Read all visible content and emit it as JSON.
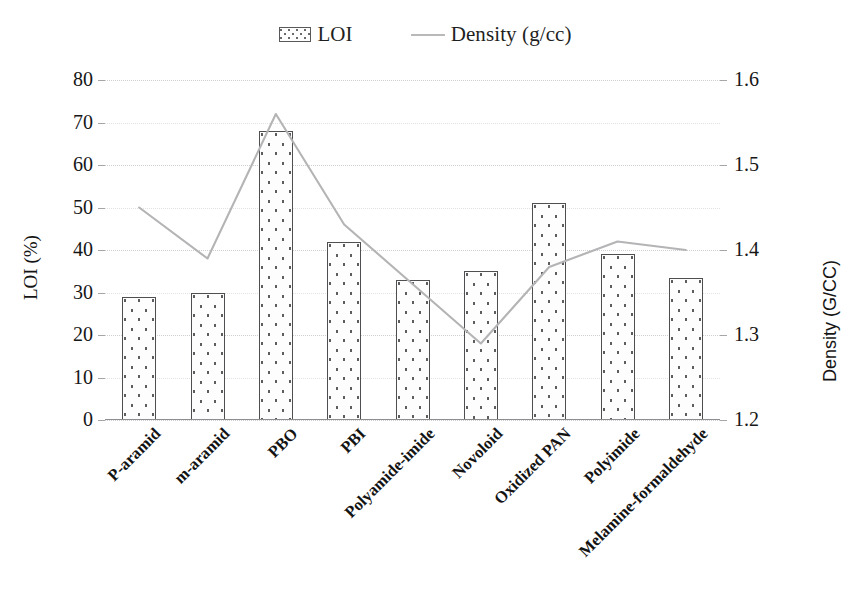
{
  "legend": {
    "position": "top-center",
    "entries": [
      {
        "label": "LOI",
        "marker": "bar-swatch-icon"
      },
      {
        "label": "Density (g/cc)",
        "marker": "line-swatch-icon"
      }
    ]
  },
  "axes": {
    "left": {
      "title": "LOI (%)",
      "ticks": [
        "0",
        "10",
        "20",
        "30",
        "40",
        "50",
        "60",
        "70",
        "80"
      ],
      "min": 0,
      "max": 80,
      "step": 10
    },
    "right": {
      "title": "Density (G/CC)",
      "ticks": [
        "1.2",
        "1.3",
        "1.4",
        "1.5",
        "1.6"
      ],
      "min": 1.2,
      "max": 1.6,
      "step": 0.1,
      "minor_step": 0.05
    }
  },
  "chart_data": {
    "type": "bar",
    "title": "",
    "xlabel": "",
    "ylabel": "LOI (%)",
    "y2label": "Density (G/CC)",
    "ylim": [
      0,
      80
    ],
    "y2lim": [
      1.2,
      1.6
    ],
    "grid": true,
    "legend_position": "top-center",
    "categories": [
      "P-aramid",
      "m-aramid",
      "PBO",
      "PBI",
      "Polyamide-imide",
      "Novoloid",
      "Oxidized PAN",
      "Polyimide",
      "Melamine-formaldehyde"
    ],
    "series": [
      {
        "name": "LOI",
        "type": "bar",
        "axis": "left",
        "unit": "%",
        "values": [
          29,
          30,
          68,
          42,
          33,
          35,
          51,
          39,
          33.5
        ]
      },
      {
        "name": "Density (g/cc)",
        "type": "line",
        "axis": "right",
        "unit": "g/cc",
        "values": [
          1.45,
          1.39,
          1.56,
          1.43,
          1.36,
          1.29,
          1.38,
          1.41,
          1.4
        ]
      }
    ]
  },
  "colors": {
    "bar_outline": "#4f4f52",
    "bar_fill": "#fdfdfd",
    "bar_dots": "#5d5d60",
    "line": "#b4b4b6",
    "grid": "#cfcfd2",
    "axis": "#8d8d90",
    "text": "#161616",
    "background": "#ffffff"
  }
}
